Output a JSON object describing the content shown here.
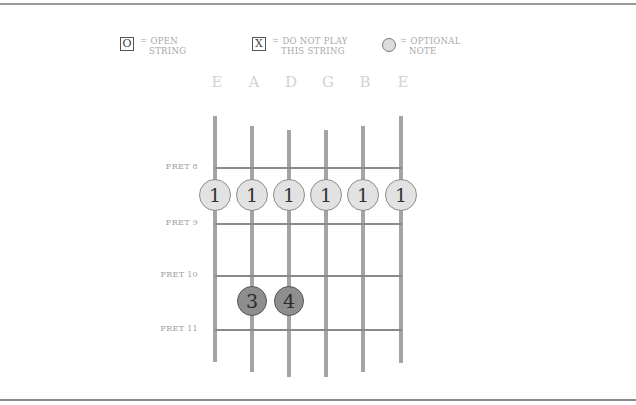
{
  "legend": {
    "open": {
      "symbol": "O",
      "text": "= OPEN\n   STRING"
    },
    "mute": {
      "symbol": "X",
      "text": "= DO NOT PLAY\n   THIS STRING"
    },
    "optional": {
      "text": "= OPTIONAL\n   NOTE"
    }
  },
  "strings": [
    {
      "name": "E",
      "x": 215,
      "top": 116,
      "bottom": 362
    },
    {
      "name": "A",
      "x": 252,
      "top": 126,
      "bottom": 372
    },
    {
      "name": "D",
      "x": 289,
      "top": 130,
      "bottom": 377
    },
    {
      "name": "G",
      "x": 326,
      "top": 130,
      "bottom": 377
    },
    {
      "name": "B",
      "x": 363,
      "top": 126,
      "bottom": 372
    },
    {
      "name": "E",
      "x": 401,
      "top": 116,
      "bottom": 363
    }
  ],
  "frets": [
    {
      "label": "FRET 8",
      "y": 167
    },
    {
      "label": "FRET 9",
      "y": 223
    },
    {
      "label": "FRET 10",
      "y": 275
    },
    {
      "label": "FRET 11",
      "y": 329
    }
  ],
  "notes": [
    {
      "finger": "1",
      "string": 0,
      "y": 195,
      "style": "light"
    },
    {
      "finger": "1",
      "string": 1,
      "y": 195,
      "style": "light"
    },
    {
      "finger": "1",
      "string": 2,
      "y": 195,
      "style": "light"
    },
    {
      "finger": "1",
      "string": 3,
      "y": 195,
      "style": "light"
    },
    {
      "finger": "1",
      "string": 4,
      "y": 195,
      "style": "light"
    },
    {
      "finger": "1",
      "string": 5,
      "y": 195,
      "style": "light"
    },
    {
      "finger": "3",
      "string": 1,
      "y": 301,
      "style": "dark"
    },
    {
      "finger": "4",
      "string": 2,
      "y": 301,
      "style": "dark"
    }
  ]
}
